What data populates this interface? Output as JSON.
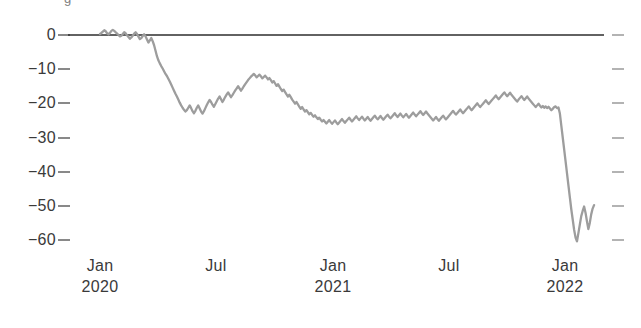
{
  "chart_data": {
    "type": "line",
    "title": "",
    "partial_clipped_header": "g",
    "xlabel": "",
    "ylabel": "",
    "ylim": [
      -64,
      3
    ],
    "yticks": [
      0,
      -10,
      -20,
      -30,
      -40,
      -50,
      -60
    ],
    "ytick_labels": [
      "0",
      "−10",
      "−20",
      "−30",
      "−40",
      "−50",
      "−60"
    ],
    "xticks": [
      "2020-01",
      "2020-07",
      "2021-01",
      "2021-07",
      "2022-01"
    ],
    "xtick_labels": [
      {
        "month": "Jan",
        "year": "2020"
      },
      {
        "month": "Jul",
        "year": ""
      },
      {
        "month": "Jan",
        "year": "2021"
      },
      {
        "month": "Jul",
        "year": ""
      },
      {
        "month": "Jan",
        "year": "2022"
      }
    ],
    "grid": false,
    "legend": null,
    "zero_line": true,
    "right_axis_ticks": true,
    "series": [
      {
        "name": "index",
        "color": "#9d9d9d",
        "x_start": "2020-01-01",
        "x_end": "2022-02-15",
        "values": [
          0.3,
          0.6,
          1.0,
          1.4,
          1.1,
          0.5,
          0.2,
          0.6,
          1.2,
          1.5,
          1.2,
          0.8,
          0.4,
          0.0,
          -0.4,
          -0.2,
          0.3,
          0.8,
          0.5,
          -0.1,
          -0.6,
          -1.1,
          -0.7,
          -0.2,
          0.4,
          0.8,
          0.3,
          -0.5,
          -1.2,
          -0.9,
          -0.3,
          0.2,
          -0.4,
          -1.3,
          -2.2,
          -1.6,
          -0.9,
          -1.8,
          -3.0,
          -4.6,
          -6.2,
          -7.4,
          -8.3,
          -9.1,
          -9.8,
          -10.6,
          -11.4,
          -12.0,
          -12.8,
          -13.6,
          -14.5,
          -15.4,
          -16.3,
          -17.2,
          -18.0,
          -18.9,
          -19.8,
          -20.6,
          -21.3,
          -21.9,
          -22.4,
          -22.0,
          -21.3,
          -20.6,
          -21.4,
          -22.3,
          -22.9,
          -22.2,
          -21.3,
          -20.6,
          -21.5,
          -22.4,
          -23.0,
          -22.3,
          -21.4,
          -20.5,
          -19.7,
          -19.0,
          -19.6,
          -20.4,
          -21.0,
          -20.2,
          -19.4,
          -18.6,
          -18.0,
          -18.8,
          -19.6,
          -18.9,
          -18.1,
          -17.4,
          -16.8,
          -17.5,
          -18.2,
          -17.6,
          -16.9,
          -16.2,
          -15.6,
          -15.0,
          -15.6,
          -16.3,
          -15.7,
          -15.0,
          -14.4,
          -13.8,
          -13.2,
          -12.7,
          -12.2,
          -11.8,
          -11.4,
          -11.8,
          -12.4,
          -12.0,
          -11.6,
          -12.1,
          -12.7,
          -12.3,
          -11.9,
          -12.4,
          -13.0,
          -12.6,
          -13.2,
          -13.9,
          -13.5,
          -14.2,
          -14.9,
          -14.4,
          -15.1,
          -15.8,
          -16.4,
          -16.0,
          -16.7,
          -17.4,
          -18.0,
          -17.5,
          -18.2,
          -18.9,
          -19.5,
          -20.1,
          -19.6,
          -20.3,
          -21.0,
          -21.6,
          -21.1,
          -21.8,
          -22.4,
          -22.0,
          -22.6,
          -23.2,
          -22.8,
          -23.4,
          -23.9,
          -23.5,
          -24.1,
          -24.6,
          -24.2,
          -24.8,
          -25.3,
          -24.9,
          -25.4,
          -25.9,
          -25.4,
          -24.9,
          -25.5,
          -26.0,
          -25.5,
          -25.0,
          -25.6,
          -26.1,
          -25.6,
          -25.1,
          -24.6,
          -25.2,
          -25.7,
          -25.2,
          -24.7,
          -24.2,
          -24.8,
          -25.3,
          -24.8,
          -24.3,
          -23.8,
          -24.4,
          -24.9,
          -24.4,
          -23.9,
          -24.5,
          -25.0,
          -24.5,
          -24.0,
          -24.6,
          -25.1,
          -24.6,
          -24.1,
          -23.6,
          -24.2,
          -24.7,
          -24.2,
          -23.7,
          -24.3,
          -24.8,
          -24.3,
          -23.8,
          -23.3,
          -23.9,
          -24.4,
          -23.9,
          -23.4,
          -22.9,
          -23.5,
          -24.0,
          -23.5,
          -23.0,
          -23.6,
          -24.1,
          -23.6,
          -23.1,
          -23.7,
          -24.2,
          -23.7,
          -23.2,
          -22.7,
          -23.3,
          -23.8,
          -23.3,
          -22.8,
          -22.3,
          -22.9,
          -23.4,
          -22.9,
          -22.4,
          -23.0,
          -23.5,
          -24.0,
          -24.5,
          -25.0,
          -24.5,
          -24.0,
          -24.6,
          -25.1,
          -24.6,
          -24.1,
          -23.6,
          -24.2,
          -24.7,
          -24.2,
          -23.7,
          -23.2,
          -22.7,
          -22.2,
          -22.8,
          -23.3,
          -22.8,
          -22.3,
          -21.8,
          -22.4,
          -22.9,
          -22.4,
          -21.9,
          -21.4,
          -20.9,
          -21.5,
          -22.0,
          -21.5,
          -21.0,
          -20.5,
          -20.0,
          -20.6,
          -21.1,
          -20.6,
          -20.1,
          -19.6,
          -19.1,
          -19.7,
          -20.2,
          -19.7,
          -19.2,
          -18.7,
          -18.2,
          -17.7,
          -18.3,
          -18.8,
          -18.3,
          -17.8,
          -17.3,
          -16.8,
          -17.4,
          -17.9,
          -17.4,
          -16.9,
          -17.5,
          -18.0,
          -18.5,
          -19.0,
          -19.5,
          -18.9,
          -18.4,
          -17.9,
          -18.5,
          -19.0,
          -18.5,
          -18.0,
          -18.6,
          -19.1,
          -19.6,
          -20.1,
          -20.6,
          -21.1,
          -20.6,
          -20.1,
          -20.7,
          -21.2,
          -20.8,
          -21.3,
          -20.9,
          -21.4,
          -21.0,
          -21.5,
          -22.0,
          -21.6,
          -21.1,
          -20.9,
          -21.4,
          -21.2,
          -23.0,
          -26.5,
          -30.0,
          -33.5,
          -37.0,
          -40.5,
          -44.0,
          -47.5,
          -51.0,
          -54.0,
          -57.0,
          -59.3,
          -60.4,
          -58.0,
          -55.5,
          -53.0,
          -51.5,
          -50.2,
          -52.0,
          -54.5,
          -56.8,
          -55.0,
          -52.5,
          -50.8,
          -49.8
        ],
        "annotations": [
          {
            "label": "COVID crash",
            "approx_x": "2020-03",
            "approx_y": -22
          },
          {
            "label": "partial recovery peak",
            "approx_x": "2020-06",
            "approx_y": -11.4
          },
          {
            "label": "plateau",
            "approx_x": "2021-01",
            "approx_y": -25
          },
          {
            "label": "late-2021 high",
            "approx_x": "2021-11",
            "approx_y": -17
          },
          {
            "label": "Omicron / final crash low",
            "approx_x": "2022-01",
            "approx_y": -60
          }
        ]
      }
    ]
  },
  "axis_geometry": {
    "plot_left": 68,
    "plot_right": 600,
    "plot_top": 30,
    "plot_bottom": 248,
    "y_zero_px": 35,
    "y_minus60_px": 240,
    "x_jan2020_px": 100,
    "x_jan2022_px": 565
  }
}
